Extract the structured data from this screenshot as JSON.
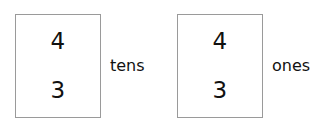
{
  "page": {
    "background_color": "#ffffff",
    "text_color": "#111111",
    "border_color": "#9a9a9a"
  },
  "place_value_groups": [
    {
      "name": "tens",
      "label": "tens",
      "digits": {
        "top": "4",
        "bottom": "3"
      }
    },
    {
      "name": "ones",
      "label": "ones",
      "digits": {
        "top": "4",
        "bottom": "3"
      }
    }
  ]
}
